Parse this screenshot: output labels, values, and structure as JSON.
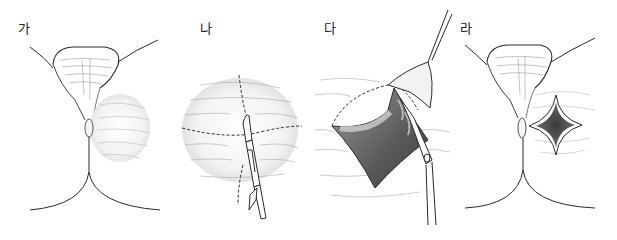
{
  "figure": {
    "type": "surgical-procedure-illustration",
    "panels": [
      {
        "label": "가",
        "description": "Perineal view with swelling lateral to the anus"
      },
      {
        "label": "나",
        "description": "Cruciate incision lines marked with dashed lines; scalpel incising"
      },
      {
        "label": "다",
        "description": "Skin flaps lifted with forceps and excised with scissors along dashed line"
      },
      {
        "label": "라",
        "description": "Resulting diamond-shaped (unroofed) wound lateral to anus"
      }
    ]
  },
  "colors": {
    "line": "#2a2a2a",
    "shade": "#8a8a8a",
    "dark_cavity": "#4a4a4a",
    "background": "#ffffff"
  }
}
